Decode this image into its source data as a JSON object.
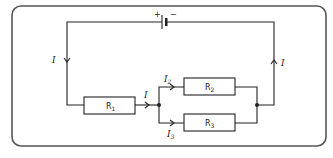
{
  "diagram": {
    "type": "circuit",
    "battery": {
      "plus": "+",
      "minus": "−"
    },
    "resistors": [
      {
        "id": "R1",
        "label": "R",
        "sub": "1"
      },
      {
        "id": "R2",
        "label": "R",
        "sub": "2"
      },
      {
        "id": "R3",
        "label": "R",
        "sub": "3"
      }
    ],
    "currents": {
      "left": "I",
      "right": "I",
      "middle": "I",
      "branch2": {
        "label": "I",
        "sub": "2"
      },
      "branch3": {
        "label": "I",
        "sub": "3"
      }
    },
    "colors": {
      "wire": "#222222",
      "frame": "#555555",
      "background": "#ffffff"
    }
  }
}
